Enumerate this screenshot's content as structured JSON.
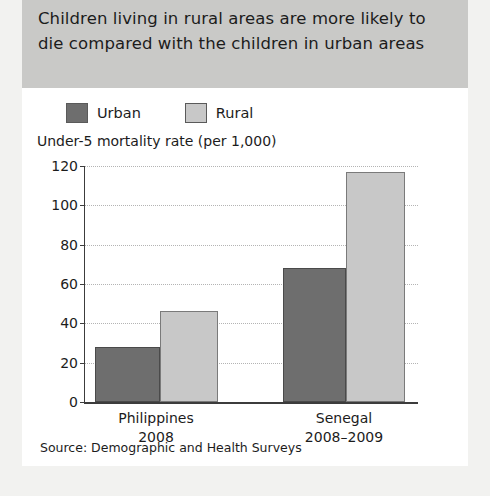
{
  "title": "Children living in rural areas are more likely to die compared with the children in urban areas",
  "source_note": "Source: Demographic and Health Surveys",
  "colors": {
    "urban": "#6e6e6e",
    "rural": "#c8c8c8",
    "banner": "#c9c9c7",
    "page": "#f2f2f0",
    "card": "#ffffff",
    "axis": "#3c3c3c",
    "grid": "#b4b4b4"
  },
  "chart_data": {
    "type": "bar",
    "title": "Children living in rural areas are more likely to die compared with the children in urban areas",
    "ylabel": "Under-5 mortality rate (per 1,000)",
    "xlabel": "",
    "ylim": [
      0,
      120
    ],
    "yticks": [
      0,
      20,
      40,
      60,
      80,
      100,
      120
    ],
    "ytick_labels": [
      "0",
      "20",
      "40",
      "60",
      "80",
      "100",
      "120"
    ],
    "grid": true,
    "legend_position": "top-left",
    "categories": [
      "Philippines",
      "Senegal"
    ],
    "category_sublabels": [
      "2008",
      "2008–2009"
    ],
    "series": [
      {
        "name": "Urban",
        "color": "#6e6e6e",
        "values": [
          28,
          68
        ]
      },
      {
        "name": "Rural",
        "color": "#c8c8c8",
        "values": [
          46.5,
          117
        ]
      }
    ],
    "source": "Demographic and Health Surveys"
  }
}
